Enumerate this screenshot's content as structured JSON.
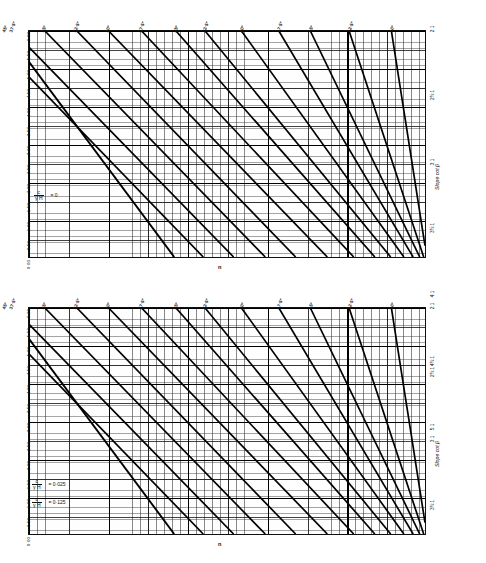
{
  "figure": {
    "kind": "slope-stability-design-charts",
    "panel_count": 2
  },
  "axes_common": {
    "y_title": "n",
    "x_title": "Slope cot β",
    "y_ticks": [
      "6·00",
      "5·50",
      "5·00",
      "4·50",
      "4·00",
      "3·50",
      "3·00",
      "2·50",
      "2·00",
      "1·50",
      "1·00",
      "0·50",
      "0·00"
    ],
    "y_values": [
      6.0,
      5.5,
      5.0,
      4.5,
      4.0,
      3.5,
      3.0,
      2.5,
      2.0,
      1.5,
      1.0,
      0.5,
      0.0
    ],
    "x_ticks": [
      "2:1",
      "2½:1",
      "3:1",
      "3½:1",
      "4:1",
      "4½:1",
      "5:1"
    ],
    "x_values": [
      2.0,
      2.5,
      3.0,
      3.5,
      4.0,
      4.5,
      5.0
    ],
    "phi_labels": [
      "45°",
      "40°",
      "37·5°",
      "35°",
      "32·5°",
      "30°",
      "27·5°",
      "25°",
      "22·5°",
      "20°",
      "17·5°",
      "15°",
      "12·5°",
      "10°"
    ]
  },
  "panels": [
    {
      "id": "top",
      "formula_lines": [
        {
          "numerator": "c",
          "denominator": "γ H",
          "equals": "= 0"
        }
      ],
      "notes": ""
    },
    {
      "id": "bottom",
      "formula_lines": [
        {
          "numerator": "c",
          "denominator": "γ H",
          "equals": "= 0·025"
        },
        {
          "numerator": "c",
          "denominator": "γ H",
          "equals": "= 0·125"
        }
      ],
      "notes": ""
    }
  ],
  "chart_data": [
    {
      "type": "line",
      "title": "",
      "xlabel": "Slope cot β",
      "ylabel": "n",
      "xlim": [
        2.0,
        5.0
      ],
      "ylim": [
        0.0,
        6.0
      ],
      "grid": true,
      "legend": "angle labels along top edge",
      "annotation": "c/γH = 0",
      "x": [
        2.0,
        5.0
      ],
      "series": [
        {
          "name": "45°",
          "x": [
            2.0,
            3.1
          ],
          "values": [
            5.18,
            0.0
          ]
        },
        {
          "name": "40°",
          "x": [
            2.0,
            3.32
          ],
          "values": [
            4.78,
            0.0
          ]
        },
        {
          "name": "37·5°",
          "x": [
            2.22,
            3.55
          ],
          "values": [
            4.78,
            0.0
          ]
        },
        {
          "name": "35°",
          "x": [
            2.46,
            3.79
          ],
          "values": [
            4.78,
            0.0
          ]
        },
        {
          "name": "32·5°",
          "x": [
            2.7,
            4.02
          ],
          "values": [
            4.78,
            0.0
          ]
        },
        {
          "name": "30°",
          "x": [
            2.94,
            4.26
          ],
          "values": [
            4.78,
            0.0
          ]
        },
        {
          "name": "27·5°",
          "x": [
            3.18,
            4.46
          ],
          "values": [
            4.78,
            0.0
          ]
        },
        {
          "name": "25°",
          "x": [
            3.42,
            4.62
          ],
          "values": [
            4.78,
            0.0
          ]
        },
        {
          "name": "22·5°",
          "x": [
            3.62,
            4.74
          ],
          "values": [
            4.78,
            0.0
          ]
        },
        {
          "name": "20°",
          "x": [
            3.86,
            4.84
          ],
          "values": [
            4.78,
            0.0
          ]
        },
        {
          "name": "17·5°",
          "x": [
            4.1,
            4.91
          ],
          "values": [
            4.78,
            0.0
          ]
        },
        {
          "name": "15°",
          "x": [
            4.3,
            4.96
          ],
          "values": [
            4.78,
            0.0
          ]
        },
        {
          "name": "12·5°",
          "x": [
            4.54,
            4.99
          ],
          "values": [
            4.78,
            0.0
          ]
        },
        {
          "name": "10°",
          "x": [
            4.8,
            5.0
          ],
          "values": [
            4.78,
            0.3
          ]
        }
      ]
    },
    {
      "type": "line",
      "title": "",
      "xlabel": "Slope cot β",
      "ylabel": "n",
      "xlim": [
        2.0,
        5.0
      ],
      "ylim": [
        0.0,
        6.0
      ],
      "grid": true,
      "legend": "angle labels along top edge",
      "annotation": "c/γH = 0·025 and c/γH = 0·125",
      "x": [
        2.0,
        5.0
      ],
      "series": [
        {
          "name": "45°",
          "x": [
            2.0,
            3.1
          ],
          "values": [
            5.18,
            0.0
          ]
        },
        {
          "name": "40°",
          "x": [
            2.0,
            3.32
          ],
          "values": [
            4.78,
            0.0
          ]
        },
        {
          "name": "37·5°",
          "x": [
            2.22,
            3.55
          ],
          "values": [
            4.78,
            0.0
          ]
        },
        {
          "name": "35°",
          "x": [
            2.46,
            3.79
          ],
          "values": [
            4.78,
            0.0
          ]
        },
        {
          "name": "32·5°",
          "x": [
            2.7,
            4.02
          ],
          "values": [
            4.78,
            0.0
          ]
        },
        {
          "name": "30°",
          "x": [
            2.94,
            4.26
          ],
          "values": [
            4.78,
            0.0
          ]
        },
        {
          "name": "27·5°",
          "x": [
            3.18,
            4.46
          ],
          "values": [
            4.78,
            0.0
          ]
        },
        {
          "name": "25°",
          "x": [
            3.42,
            4.62
          ],
          "values": [
            4.78,
            0.0
          ]
        },
        {
          "name": "22·5°",
          "x": [
            3.62,
            4.74
          ],
          "values": [
            4.78,
            0.0
          ]
        },
        {
          "name": "20°",
          "x": [
            3.86,
            4.84
          ],
          "values": [
            4.78,
            0.0
          ]
        },
        {
          "name": "17·5°",
          "x": [
            4.1,
            4.91
          ],
          "values": [
            4.78,
            0.0
          ]
        },
        {
          "name": "15°",
          "x": [
            4.3,
            4.96
          ],
          "values": [
            4.78,
            0.0
          ]
        },
        {
          "name": "12·5°",
          "x": [
            4.54,
            4.99
          ],
          "values": [
            4.78,
            0.0
          ]
        },
        {
          "name": "10°",
          "x": [
            4.8,
            5.0
          ],
          "values": [
            4.78,
            0.3
          ]
        }
      ]
    }
  ]
}
